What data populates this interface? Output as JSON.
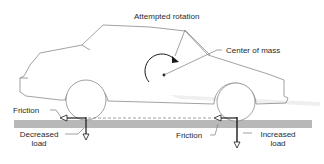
{
  "diagram": {
    "labels": {
      "attempted_rotation": "Attempted rotation",
      "center_of_mass": "Center of mass",
      "friction_rear": "Friction",
      "friction_front": "Friction",
      "decreased_load_line1": "Decreased",
      "decreased_load_line2": "load",
      "increased_load_line1": "Increased",
      "increased_load_line2": "load"
    },
    "colors": {
      "outline": "#7a7a7a",
      "ground": "#b8b8b8",
      "arrow": "#1a1a1a",
      "text": "#2a2a2a"
    }
  }
}
